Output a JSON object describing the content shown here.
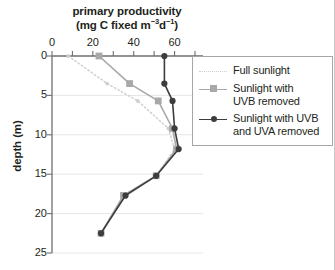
{
  "chart_data": {
    "type": "line",
    "title_line1": "primary productivity",
    "title_line2_pre": "(mg C fixed  m",
    "title_line2_sup1": "−3",
    "title_line2_mid": "d",
    "title_line2_sup2": "−1",
    "title_line2_post": ")",
    "xlabel": "primary productivity (mg C fixed m−3d−1)",
    "ylabel": "depth (m)",
    "xlim": [
      0,
      70
    ],
    "ylim": [
      0,
      25
    ],
    "y_inverted": true,
    "xticks": [
      0,
      20,
      40,
      60
    ],
    "xtick_labels": [
      "0",
      "20",
      "40",
      "60"
    ],
    "xminor_ticks": [
      10,
      30,
      50,
      70
    ],
    "yticks": [
      0,
      5,
      10,
      15,
      20,
      25
    ],
    "ytick_labels": [
      "0",
      "5",
      "10",
      "15",
      "20",
      "25"
    ],
    "grid": "horizontal",
    "legend_position": "right",
    "colors": {
      "full_sunlight": "#cfcfcf",
      "uvb_removed": "#a8a8a8",
      "uvb_uva_removed": "#3d3d3d",
      "axis": "#6f6f6f",
      "gridline": "#e6e6e6",
      "text": "#231f20"
    },
    "depths": [
      0,
      3.5,
      5.7,
      9.2,
      11.8,
      15.2,
      17.7,
      22.5
    ],
    "series": [
      {
        "name": "Full sunlight",
        "style": "dotted",
        "marker": "small-dot",
        "color": "#cfcfcf",
        "values": [
          8,
          27,
          42,
          57,
          60,
          51,
          35,
          24
        ]
      },
      {
        "name": "Sunlight with UVB removed",
        "style": "solid",
        "marker": "square",
        "color": "#a8a8a8",
        "values": [
          23,
          38,
          52,
          59,
          61,
          51,
          35,
          24
        ]
      },
      {
        "name": "Sunlight with UVB and UVA removed",
        "style": "solid",
        "marker": "circle",
        "color": "#3d3d3d",
        "values": [
          55,
          55,
          59,
          60,
          62,
          51,
          36,
          24
        ]
      }
    ]
  },
  "legend": {
    "items": [
      {
        "label_line1": "Full sunlight",
        "label_line2": ""
      },
      {
        "label_line1": "Sunlight with",
        "label_line2": "UVB removed"
      },
      {
        "label_line1": "Sunlight with UVB",
        "label_line2": "and UVA removed"
      }
    ]
  }
}
